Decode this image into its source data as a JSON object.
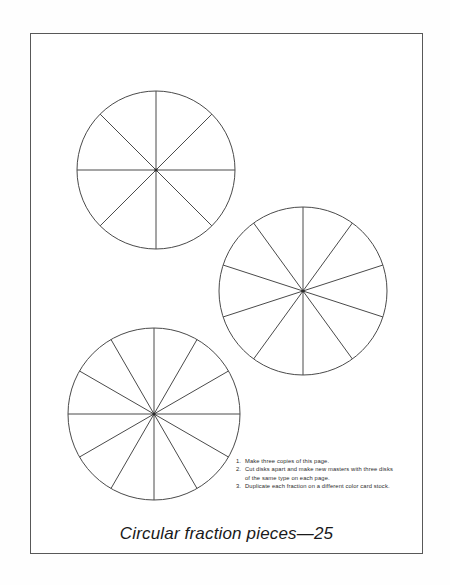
{
  "page": {
    "caption": "Circular fraction pieces—25",
    "border_color": "#585858",
    "background_color": "#ffffff",
    "line_color": "#4a4a4a"
  },
  "disks": [
    {
      "name": "disk-eighths",
      "sectors": 8,
      "cx": 156,
      "cy": 170,
      "r": 79
    },
    {
      "name": "disk-tenths",
      "sectors": 10,
      "cx": 303,
      "cy": 291,
      "r": 84
    },
    {
      "name": "disk-twelfths",
      "sectors": 12,
      "cx": 154,
      "cy": 414,
      "r": 86
    }
  ],
  "instructions": [
    {
      "number": "1.",
      "text": "Make three copies of this page."
    },
    {
      "number": "2.",
      "text": "Cut disks apart and make new masters with three disks of the same type on each page."
    },
    {
      "number": "3.",
      "text": "Duplicate each fraction on a different color card stock."
    }
  ]
}
